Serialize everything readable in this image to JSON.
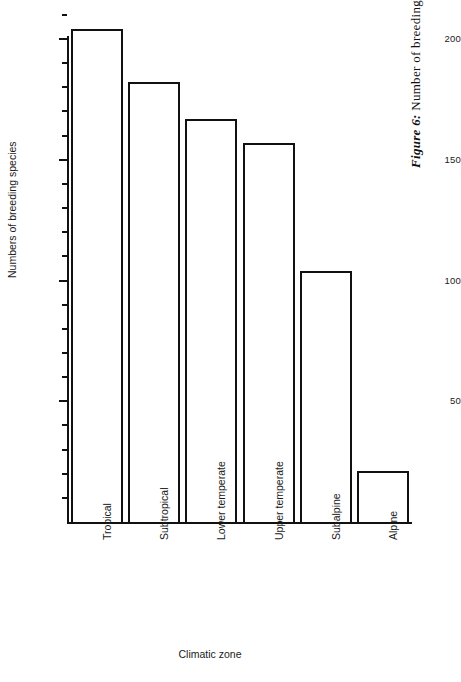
{
  "caption": {
    "figure_number": "Figure 6:",
    "text": "Number of breeding birds in Nepal's climatic zones."
  },
  "chart_data": {
    "type": "bar",
    "title": "",
    "xlabel": "Climatic zone",
    "ylabel": "Numbers of breeding species",
    "categories": [
      "Tropical",
      "Subtropical",
      "Lower temperate",
      "Upper temperate",
      "Subalpine",
      "Alpine"
    ],
    "values": [
      204,
      182,
      167,
      157,
      104,
      21
    ],
    "ylim": [
      0,
      210
    ],
    "xlim": [
      0,
      6
    ],
    "y_major_ticks": [
      50,
      100,
      150,
      200
    ],
    "y_major_tick_labels": [
      "50",
      "100",
      "150",
      "200"
    ],
    "y_minor_tick_interval": 10,
    "grid": false,
    "legend": null,
    "bar_facecolor": "#ffffff",
    "bar_edgecolor": "#111111",
    "axis_color": "#111111",
    "background": "#ffffff"
  }
}
